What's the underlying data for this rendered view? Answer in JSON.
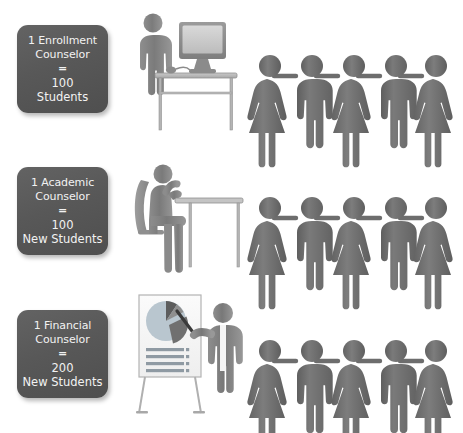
{
  "infographic": {
    "title": "Counselor to student ratio infographic",
    "background_color": "#ffffff",
    "figure_color": "#6e6e6e",
    "box_color": "#585858",
    "box_text_color": "#f2f2f2"
  },
  "rows": [
    {
      "id": "enrollment",
      "label": {
        "role_line_1": "1 Enrollment",
        "role_line_2": "Counselor",
        "equals": "=",
        "amount": "100",
        "unit": "Students"
      },
      "illustration": {
        "name": "person-standing-at-desk-with-computer",
        "parts": [
          "standing-person",
          "desk",
          "monitor",
          "mouse"
        ]
      },
      "people": {
        "count": 5,
        "genders": [
          "female",
          "male",
          "female",
          "male",
          "female"
        ],
        "holding_hands": true
      }
    },
    {
      "id": "academic",
      "label": {
        "role_line_1": "1 Academic",
        "role_line_2": "Counselor",
        "equals": "=",
        "amount": "100",
        "unit": "New Students"
      },
      "illustration": {
        "name": "person-seated-at-desk",
        "parts": [
          "seated-person",
          "chair",
          "desk"
        ]
      },
      "people": {
        "count": 5,
        "genders": [
          "female",
          "male",
          "female",
          "male",
          "female"
        ],
        "holding_hands": true
      }
    },
    {
      "id": "financial",
      "label": {
        "role_line_1": "1 Financial",
        "role_line_2": "Counselor",
        "equals": "=",
        "amount": "200",
        "unit": "New Students"
      },
      "illustration": {
        "name": "presenter-with-flipchart-pie-chart",
        "parts": [
          "flipchart",
          "pie-chart",
          "bullet-lines",
          "presenter",
          "pointer"
        ]
      },
      "people": {
        "count": 5,
        "genders": [
          "female",
          "male",
          "female",
          "male",
          "female"
        ],
        "holding_hands": true
      }
    }
  ]
}
